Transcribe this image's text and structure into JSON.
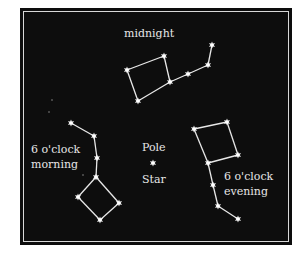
{
  "diagram": {
    "labels": {
      "midnight": "midnight",
      "morning_line1": "6 o'clock",
      "morning_line2": "morning",
      "evening_line1": "6 o'clock",
      "evening_line2": "evening",
      "pole_line1": "Pole",
      "pole_line2": "Star"
    },
    "colors": {
      "background": "#0d0d0d",
      "stars": "#ffffff",
      "text": "#e6e6e6",
      "frame": "#ffffff"
    },
    "constellations": [
      {
        "name": "midnight",
        "stars": 7
      },
      {
        "name": "6-oclock-morning",
        "stars": 7
      },
      {
        "name": "6-oclock-evening",
        "stars": 7
      }
    ],
    "pole_star": "Pole Star"
  }
}
